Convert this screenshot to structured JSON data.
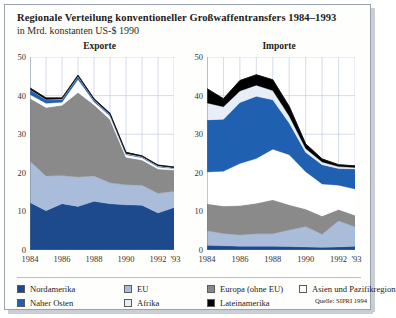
{
  "header": {
    "title": "Regionale Verteilung konventioneller Großwaffentransfers 1984–1993",
    "subtitle": "in Mrd. konstanten US-$ 1990"
  },
  "source_note": "Quelle: SIPRI 1994",
  "colors": {
    "nordamerika": "#1d4a8c",
    "eu": "#a9bddb",
    "europa_ohne_eu": "#8a8a8a",
    "asien_pazifik": "#ffffff",
    "naher_osten": "#1f60b0",
    "afrika": "#e8eef7",
    "lateinamerika": "#000000",
    "grid": "#b9c6d8",
    "axis": "#6d7a88",
    "frame_border": "#9aa3ad"
  },
  "legend": {
    "items": [
      {
        "label": "Nordamerika",
        "color": "#1d4a8c",
        "icon": "legend-swatch-icon"
      },
      {
        "label": "EU",
        "color": "#a9bddb",
        "icon": "legend-swatch-icon"
      },
      {
        "label": "Europa (ohne EU)",
        "color": "#8a8a8a",
        "icon": "legend-swatch-icon"
      },
      {
        "label": "Asien und Pazifikregion",
        "color": "#ffffff",
        "icon": "legend-swatch-icon"
      },
      {
        "label": "Naher Osten",
        "color": "#1f60b0",
        "icon": "legend-swatch-icon"
      },
      {
        "label": "Afrika",
        "color": "#e8eef7",
        "icon": "legend-swatch-icon"
      },
      {
        "label": "Lateinamerika",
        "color": "#000000",
        "icon": "legend-swatch-icon"
      }
    ]
  },
  "chart_data": [
    {
      "type": "area",
      "id": "exporte",
      "title": "Exporte",
      "xlabel": "",
      "ylabel": "",
      "ylim": [
        0,
        50
      ],
      "yticks": [
        0,
        10,
        20,
        30,
        40,
        50
      ],
      "ytick_labels": [
        "0",
        "10",
        "20",
        "30",
        "40",
        "50"
      ],
      "x": [
        1984,
        1985,
        1986,
        1987,
        1988,
        1989,
        1990,
        1991,
        1992,
        1993
      ],
      "xtick_labels": [
        "1984",
        "1986",
        "1988",
        "1990",
        "1992",
        "'93"
      ],
      "xticks": [
        1984,
        1986,
        1988,
        1990,
        1992,
        1993
      ],
      "grid": true,
      "stacked": true,
      "series": [
        {
          "name": "Nordamerika",
          "color": "#1d4a8c",
          "values": [
            12.3,
            10.2,
            12.0,
            11.3,
            12.6,
            12.0,
            11.7,
            11.6,
            9.6,
            11.0
          ]
        },
        {
          "name": "EU",
          "color": "#a9bddb",
          "values": [
            10.7,
            9.0,
            7.3,
            7.6,
            6.6,
            5.4,
            5.2,
            5.2,
            5.1,
            4.2
          ]
        },
        {
          "name": "Europa (ohne EU)",
          "color": "#8a8a8a",
          "values": [
            16.3,
            17.7,
            18.2,
            21.9,
            18.4,
            16.4,
            7.1,
            6.5,
            6.3,
            5.5
          ]
        },
        {
          "name": "Asien und Pazifikregion",
          "color": "#ffffff",
          "values": [
            1.0,
            1.1,
            0.8,
            3.4,
            0.8,
            0.9,
            0.7,
            0.6,
            0.5,
            0.4
          ]
        },
        {
          "name": "Naher Osten",
          "color": "#1f60b0",
          "values": [
            1.2,
            0.9,
            0.7,
            0.7,
            0.4,
            0.3,
            0.2,
            0.2,
            0.2,
            0.1
          ]
        },
        {
          "name": "Afrika",
          "color": "#e8eef7",
          "values": [
            0.1,
            0.1,
            0.1,
            0.1,
            0.1,
            0.1,
            0.1,
            0.1,
            0.1,
            0.1
          ]
        },
        {
          "name": "Lateinamerika",
          "color": "#000000",
          "values": [
            0.4,
            0.4,
            0.3,
            0.3,
            0.3,
            0.3,
            0.3,
            0.2,
            0.2,
            0.2
          ]
        }
      ],
      "totals": [
        42.0,
        39.4,
        39.4,
        45.3,
        39.2,
        35.4,
        25.3,
        24.4,
        22.0,
        21.5
      ]
    },
    {
      "type": "area",
      "id": "importe",
      "title": "Importe",
      "xlabel": "",
      "ylabel": "",
      "ylim": [
        0,
        50
      ],
      "yticks": [
        0,
        10,
        20,
        30,
        40,
        50
      ],
      "ytick_labels": [
        "0",
        "10",
        "20",
        "30",
        "40",
        "50"
      ],
      "x": [
        1984,
        1985,
        1986,
        1987,
        1988,
        1989,
        1990,
        1991,
        1992,
        1993
      ],
      "xtick_labels": [
        "1984",
        "1986",
        "1988",
        "1990",
        "1992",
        "'93"
      ],
      "xticks": [
        1984,
        1986,
        1988,
        1990,
        1992,
        1993
      ],
      "grid": true,
      "stacked": true,
      "series": [
        {
          "name": "Nordamerika",
          "color": "#1d4a8c",
          "values": [
            1.2,
            1.1,
            1.0,
            1.0,
            1.0,
            0.9,
            0.8,
            0.7,
            0.8,
            1.0
          ]
        },
        {
          "name": "EU",
          "color": "#a9bddb",
          "values": [
            3.8,
            3.2,
            2.9,
            3.2,
            3.2,
            4.3,
            5.3,
            3.4,
            6.8,
            5.0
          ]
        },
        {
          "name": "Europa (ohne EU)",
          "color": "#8a8a8a",
          "values": [
            7.0,
            7.1,
            7.6,
            7.9,
            8.8,
            6.5,
            4.5,
            4.7,
            2.9,
            3.0
          ]
        },
        {
          "name": "Asien und Pazifikregion",
          "color": "#ffffff",
          "values": [
            8.2,
            9.0,
            10.9,
            11.6,
            13.1,
            13.0,
            9.7,
            8.3,
            6.3,
            6.8
          ]
        },
        {
          "name": "Naher Osten",
          "color": "#1f60b0",
          "values": [
            13.5,
            13.5,
            15.8,
            16.1,
            12.8,
            8.2,
            5.0,
            5.0,
            4.3,
            5.2
          ]
        },
        {
          "name": "Afrika",
          "color": "#e8eef7",
          "values": [
            4.4,
            3.2,
            3.0,
            2.9,
            2.4,
            1.8,
            1.0,
            0.7,
            0.5,
            0.4
          ]
        },
        {
          "name": "Lateinamerika",
          "color": "#000000",
          "values": [
            3.7,
            2.1,
            2.7,
            2.7,
            2.8,
            2.5,
            1.2,
            0.8,
            0.5,
            0.4
          ]
        }
      ],
      "totals": [
        41.8,
        39.2,
        43.9,
        45.4,
        44.1,
        37.2,
        27.5,
        23.6,
        22.1,
        21.8
      ]
    }
  ]
}
